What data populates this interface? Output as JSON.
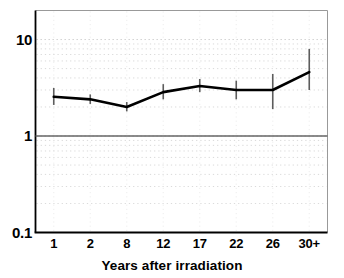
{
  "chart_data": {
    "type": "line",
    "title": "",
    "subtitle": "",
    "xlabel": "Years after irradiation",
    "ylabel": "",
    "categories": [
      "1",
      "2",
      "8",
      "12",
      "17",
      "22",
      "26",
      "30+"
    ],
    "series": [
      {
        "name": "Relative risk",
        "values": [
          2.55,
          2.4,
          2.0,
          2.85,
          3.3,
          3.0,
          3.0,
          4.6
        ],
        "error_low": [
          2.1,
          2.15,
          1.8,
          2.4,
          2.85,
          2.4,
          1.9,
          3.0
        ],
        "error_high": [
          3.15,
          2.7,
          2.25,
          3.45,
          3.9,
          3.75,
          4.4,
          8.0
        ]
      }
    ],
    "yscale": "log",
    "ylim": [
      0.1,
      20
    ],
    "ytick_labels": [
      "10",
      "1",
      "0.1"
    ],
    "ytick_values": [
      10,
      1,
      0.1
    ],
    "xtick_labels": [
      "1",
      "2",
      "8",
      "12",
      "17",
      "22",
      "26",
      "30+"
    ],
    "grid": "log-minor-dotted",
    "reference_line": 1,
    "legend": "none",
    "annotations": [],
    "colors": {
      "line": "#000000",
      "error_bar": "#555555",
      "grid": "#cccccc",
      "axis": "#000000",
      "reference": "#666666",
      "background": "#ffffff"
    }
  },
  "axes": {
    "y_labels": [
      {
        "text": "10",
        "value": 10
      },
      {
        "text": "1",
        "value": 1
      },
      {
        "text": "0.1",
        "value": 0.1
      }
    ],
    "x_labels": [
      {
        "text": "1"
      },
      {
        "text": "2"
      },
      {
        "text": "8"
      },
      {
        "text": "12"
      },
      {
        "text": "17"
      },
      {
        "text": "22"
      },
      {
        "text": "26"
      },
      {
        "text": "30+"
      }
    ],
    "x_title": "Years after irradiation"
  }
}
